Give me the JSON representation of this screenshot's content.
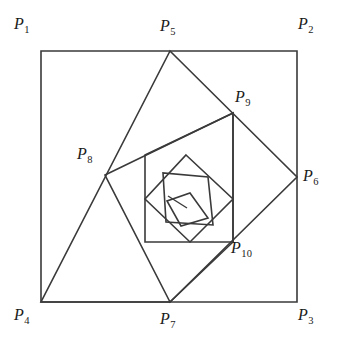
{
  "figure": {
    "background_color": "#ffffff",
    "stroke_color": "#3a3a3a",
    "stroke_width": 1.6,
    "canvas": {
      "width": 338,
      "height": 353
    }
  },
  "labels": [
    {
      "name": "label-p1",
      "base": "P",
      "sub": "1",
      "text": "P1",
      "x": 14,
      "y": 16,
      "anchor_point": [
        41,
        51
      ]
    },
    {
      "name": "label-p2",
      "base": "P",
      "sub": "2",
      "text": "P2",
      "x": 298,
      "y": 16,
      "anchor_point": [
        297,
        51
      ]
    },
    {
      "name": "label-p3",
      "base": "P",
      "sub": "3",
      "text": "P3",
      "x": 298,
      "y": 307,
      "anchor_point": [
        297,
        302
      ]
    },
    {
      "name": "label-p4",
      "base": "P",
      "sub": "4",
      "text": "P4",
      "x": 14,
      "y": 307,
      "anchor_point": [
        41,
        302
      ]
    },
    {
      "name": "label-p5",
      "base": "P",
      "sub": "5",
      "text": "P5",
      "x": 160,
      "y": 18,
      "anchor_point": [
        170,
        51
      ]
    },
    {
      "name": "label-p6",
      "base": "P",
      "sub": "6",
      "text": "P6",
      "x": 303,
      "y": 168,
      "anchor_point": [
        297,
        177
      ]
    },
    {
      "name": "label-p7",
      "base": "P",
      "sub": "7",
      "text": "P7",
      "x": 160,
      "y": 311,
      "anchor_point": [
        170,
        302
      ]
    },
    {
      "name": "label-p8",
      "base": "P",
      "sub": "8",
      "text": "P8",
      "x": 77,
      "y": 146,
      "anchor_point": [
        105,
        175
      ]
    },
    {
      "name": "label-p9",
      "base": "P",
      "sub": "9",
      "text": "P9",
      "x": 235,
      "y": 89,
      "anchor_point": [
        233,
        113
      ]
    },
    {
      "name": "label-p10",
      "base": "P",
      "sub": "10",
      "text": "P10",
      "x": 231,
      "y": 240,
      "anchor_point": [
        233,
        242
      ]
    }
  ],
  "chart_data": {
    "type": "diagram",
    "xlim": [
      0,
      338
    ],
    "ylim": [
      0,
      353
    ],
    "grid": false,
    "legend": null,
    "points": {
      "P1": [
        41,
        51
      ],
      "P2": [
        297,
        51
      ],
      "P3": [
        297,
        302
      ],
      "P4": [
        41,
        302
      ],
      "P5": [
        170,
        51
      ],
      "P6": [
        297,
        177
      ],
      "P7": [
        170,
        302
      ],
      "P8": [
        105,
        175
      ],
      "P9": [
        233,
        113
      ],
      "P10": [
        233,
        242
      ],
      "Q1": [
        145,
        242
      ],
      "Q2": [
        145,
        155
      ],
      "R1": [
        186,
        155
      ],
      "R2": [
        233,
        199
      ],
      "R3": [
        190,
        242
      ],
      "R4": [
        145,
        199
      ],
      "S1": [
        208,
        177
      ],
      "S2": [
        213,
        225
      ],
      "S3": [
        166,
        222
      ],
      "S4": [
        163,
        173
      ],
      "T1": [
        190,
        193
      ],
      "T2": [
        208,
        218
      ],
      "T3": [
        181,
        226
      ],
      "T4": [
        167,
        201
      ],
      "U1": [
        187,
        208
      ],
      "U2": [
        168,
        196
      ]
    },
    "polygons": [
      {
        "name": "square-1-outer",
        "label": "P1 P2 P3 P4",
        "vertices": [
          "P1",
          "P2",
          "P3",
          "P4"
        ],
        "closed": true
      },
      {
        "name": "square-2",
        "label": "P5 P6 P7 P4",
        "vertices": [
          "P5",
          "P6",
          "P7",
          "P4"
        ],
        "closed": true
      },
      {
        "name": "square-3",
        "label": "P8 P9 P10 P7",
        "vertices": [
          "P8",
          "P9",
          "P10",
          "P7"
        ],
        "closed": true
      },
      {
        "name": "square-4",
        "label": "P8 P9 P10 Q1",
        "vertices": [
          "Q2",
          "P9",
          "P10",
          "Q1"
        ],
        "closed": true
      },
      {
        "name": "square-5",
        "label": "R1 R2 R3 R4",
        "vertices": [
          "R1",
          "R2",
          "R3",
          "R4"
        ],
        "closed": true
      },
      {
        "name": "square-6",
        "label": "S1 S2 S3 S4",
        "vertices": [
          "S1",
          "S2",
          "S3",
          "S4"
        ],
        "closed": true
      },
      {
        "name": "square-7",
        "label": "T1 T2 T3 T4",
        "vertices": [
          "T1",
          "T2",
          "T3",
          "T4"
        ],
        "closed": true
      }
    ],
    "segments": [
      {
        "name": "innermost-tick",
        "from": "U2",
        "to": "U1"
      }
    ]
  }
}
